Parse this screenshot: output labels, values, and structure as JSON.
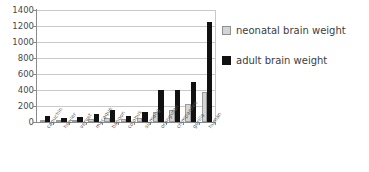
{
  "chart_data": {
    "type": "bar",
    "title": "",
    "xlabel": "",
    "ylabel": "",
    "ylim": [
      0,
      1400
    ],
    "yticks": [
      0,
      200,
      400,
      600,
      800,
      1000,
      1200,
      1400
    ],
    "grid": true,
    "legend_position": "right",
    "categories": [
      "capuchin",
      "howler",
      "vervet",
      "macaque",
      "baboon",
      "colobus",
      "siamang",
      "orangutan",
      "chimpanzee",
      "gorilla",
      "human"
    ],
    "series": [
      {
        "name": "neonatal brain weight",
        "color": "#d4d4d4",
        "values": [
          20,
          18,
          25,
          40,
          55,
          35,
          45,
          130,
          150,
          230,
          380
        ]
      },
      {
        "name": "adult brain weight",
        "color": "#111111",
        "values": [
          70,
          50,
          65,
          95,
          150,
          75,
          120,
          400,
          395,
          500,
          1250
        ]
      }
    ]
  },
  "legend": {
    "items": [
      {
        "label": "neonatal brain weight"
      },
      {
        "label": "adult brain weight"
      }
    ]
  }
}
